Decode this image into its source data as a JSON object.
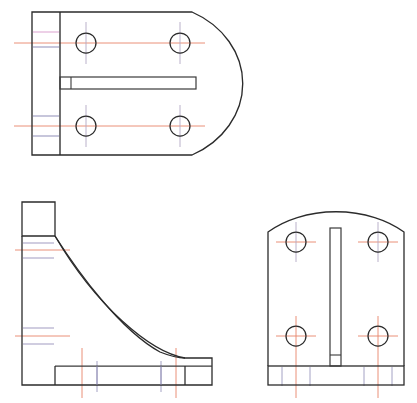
{
  "drawing": {
    "title": "Orthographic Engineering Drawing - Bracket",
    "background_color": "#ffffff",
    "canvas": {
      "width": 417,
      "height": 403
    },
    "line_colors": {
      "outline": "#2a2a2a",
      "centerline_horizontal": "#e06a4a",
      "centerline_vertical": "#9a8fb0",
      "hidden_tint_pink": "#d9a9cf",
      "hidden_tint_blue": "#8a8fc0",
      "hidden_tint_red": "#d06060",
      "edge_tint_cyan": "#7fc5d8",
      "edge_tint_magenta": "#d07fc0",
      "edge_tint_green": "#7fc08a"
    },
    "line_weights": {
      "outline": 1.3,
      "centerline": 0.9,
      "thin": 0.8
    }
  },
  "views": [
    {
      "name": "top-view",
      "label": "Top View",
      "description": "Plan view with rounded right end, mounting flange at left, central slot, four bolt holes",
      "origin": {
        "x": 32,
        "y": 12
      },
      "outline": {
        "flange_left_x": 32,
        "body_left_x": 60,
        "top_y": 12,
        "bottom_y": 155,
        "straight_right_x": 192,
        "arc_apex_x": 218,
        "arc_radius": 90
      },
      "flange_lines": [
        {
          "y": 32,
          "color": "hidden_tint_pink"
        },
        {
          "y": 38,
          "color": "centerline_horizontal"
        },
        {
          "y": 46,
          "color": "hidden_tint_blue"
        },
        {
          "y": 118,
          "color": "hidden_tint_blue"
        },
        {
          "y": 126,
          "color": "centerline_horizontal"
        },
        {
          "y": 134,
          "color": "hidden_tint_blue"
        }
      ],
      "slot": {
        "x": 62,
        "y": 78,
        "width": 134,
        "height": 11,
        "notch_x": 62,
        "notch_width": 10
      },
      "holes": [
        {
          "cx": 86,
          "cy": 43,
          "r": 10,
          "label": "hole-top-left"
        },
        {
          "cx": 180,
          "cy": 43,
          "r": 10,
          "label": "hole-top-right"
        },
        {
          "cx": 86,
          "cy": 126,
          "r": 10,
          "label": "hole-bottom-left"
        },
        {
          "cx": 180,
          "cy": 126,
          "r": 10,
          "label": "hole-bottom-right"
        }
      ]
    },
    {
      "name": "side-view",
      "label": "Side / Profile View",
      "description": "L-shaped profile with concave fillet curve joining vertical web to horizontal base",
      "origin": {
        "x": 22,
        "y": 202
      },
      "outline": {
        "web_left_x": 22,
        "web_right_x": 55,
        "top_y": 202,
        "shelf_y": 236,
        "base_top_y": 366,
        "base_bottom_y": 385,
        "base_right_x": 212,
        "foot_step_x": 185,
        "foot_step_y": 358
      },
      "flange_lines": [
        {
          "y": 243,
          "color": "hidden_tint_blue"
        },
        {
          "y": 250,
          "color": "centerline_horizontal"
        },
        {
          "y": 258,
          "color": "hidden_tint_blue"
        },
        {
          "y": 327,
          "color": "hidden_tint_blue"
        },
        {
          "y": 335,
          "color": "centerline_horizontal"
        },
        {
          "y": 343,
          "color": "hidden_tint_blue"
        }
      ],
      "vertical_centerlines": [
        {
          "x": 82,
          "y1": 348,
          "y2": 398,
          "color": "centerline_horizontal"
        },
        {
          "x": 97,
          "y1": 360,
          "y2": 392,
          "color": "centerline_vertical"
        },
        {
          "x": 176,
          "y1": 348,
          "y2": 398,
          "color": "centerline_horizontal"
        },
        {
          "x": 162,
          "y1": 360,
          "y2": 392,
          "color": "centerline_vertical"
        }
      ],
      "curve": {
        "start_x": 55,
        "start_y": 236,
        "end_x": 185,
        "end_y": 358,
        "control1_x": 96,
        "control1_y": 250,
        "control2_x": 150,
        "control2_y": 300
      }
    },
    {
      "name": "front-view",
      "label": "Front View",
      "description": "Front elevation with arched top, central vertical slot, four bolt holes and base plate",
      "origin": {
        "x": 268,
        "y": 232
      },
      "outline": {
        "left_x": 268,
        "right_x": 404,
        "shoulder_y": 232,
        "base_top_y": 366,
        "base_bottom_y": 385,
        "arc_apex_y": 203
      },
      "slot": {
        "x": 330,
        "y": 228,
        "width": 10,
        "height": 140
      },
      "holes": [
        {
          "cx": 296,
          "cy": 242,
          "r": 10,
          "label": "hole-top-left"
        },
        {
          "cx": 378,
          "cy": 242,
          "r": 10,
          "label": "hole-top-right"
        },
        {
          "cx": 296,
          "cy": 336,
          "r": 10,
          "label": "hole-bottom-left"
        },
        {
          "cx": 378,
          "cy": 336,
          "r": 10,
          "label": "hole-bottom-right"
        }
      ],
      "vertical_centerlines": [
        {
          "x": 296,
          "y1": 348,
          "y2": 398,
          "color": "centerline_horizontal"
        },
        {
          "x": 378,
          "y1": 348,
          "y2": 398,
          "color": "centerline_horizontal"
        },
        {
          "x": 282,
          "y1": 360,
          "y2": 390,
          "color": "centerline_vertical"
        },
        {
          "x": 310,
          "y1": 360,
          "y2": 390,
          "color": "centerline_vertical"
        },
        {
          "x": 364,
          "y1": 360,
          "y2": 390,
          "color": "centerline_vertical"
        },
        {
          "x": 392,
          "y1": 360,
          "y2": 390,
          "color": "centerline_vertical"
        }
      ]
    }
  ]
}
